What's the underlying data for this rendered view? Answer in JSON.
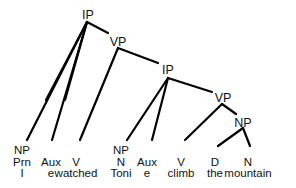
{
  "tree": {
    "internal_nodes": [
      {
        "id": "ip1",
        "label": "IP",
        "x": 88,
        "y": 9
      },
      {
        "id": "vp1",
        "label": "VP",
        "x": 118,
        "y": 36
      },
      {
        "id": "ip2",
        "label": "IP",
        "x": 168,
        "y": 64
      },
      {
        "id": "vp2",
        "label": "VP",
        "x": 223,
        "y": 92
      },
      {
        "id": "np",
        "label": "NP",
        "x": 243,
        "y": 117
      }
    ],
    "leaves": [
      {
        "id": "l1",
        "x": 22,
        "rows": [
          "NP",
          "Prn",
          "I"
        ]
      },
      {
        "id": "l2",
        "x": 51,
        "rows": [
          "",
          "Aux",
          "e"
        ]
      },
      {
        "id": "l3",
        "x": 76,
        "rows": [
          "",
          "V",
          "watched"
        ]
      },
      {
        "id": "l4",
        "x": 121,
        "rows": [
          "NP",
          "N",
          "Toni"
        ]
      },
      {
        "id": "l5",
        "x": 147,
        "rows": [
          "",
          "Aux",
          "e"
        ]
      },
      {
        "id": "l6",
        "x": 181,
        "rows": [
          "",
          "V",
          "climb"
        ]
      },
      {
        "id": "l7",
        "x": 215,
        "rows": [
          "",
          "D",
          "the"
        ]
      },
      {
        "id": "l8",
        "x": 248,
        "rows": [
          "",
          "N",
          "mountain"
        ]
      }
    ]
  }
}
